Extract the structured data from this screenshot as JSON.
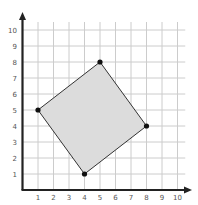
{
  "chart_data": {
    "type": "polygon-on-grid",
    "xlabel": "",
    "ylabel": "",
    "xlim": [
      0,
      10
    ],
    "ylim": [
      0,
      10
    ],
    "grid": true,
    "x_ticks": [
      "1",
      "2",
      "3",
      "4",
      "5",
      "6",
      "7",
      "8",
      "9",
      "10"
    ],
    "y_ticks": [
      "1",
      "2",
      "3",
      "4",
      "5",
      "6",
      "7",
      "8",
      "9",
      "10"
    ],
    "polygon": {
      "vertices": [
        [
          1,
          5
        ],
        [
          5,
          8
        ],
        [
          8,
          4
        ],
        [
          4,
          1
        ]
      ],
      "fill": "#dcdcdc",
      "stroke": "#333333"
    }
  },
  "colors": {
    "grid": "#cccccc",
    "axis": "#222222",
    "point": "#111111"
  }
}
